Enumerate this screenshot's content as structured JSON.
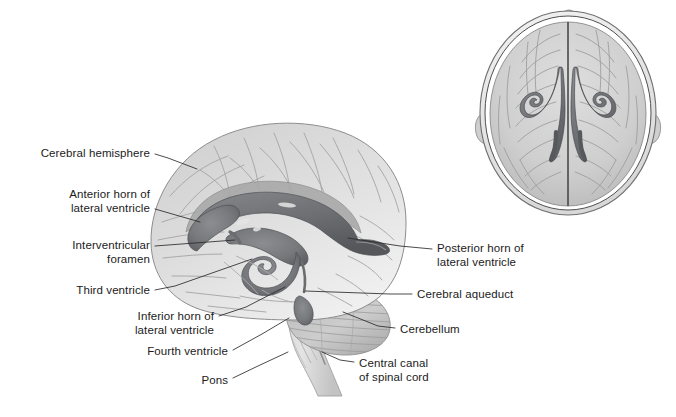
{
  "figure": {
    "background_color": "#ffffff",
    "label_color": "#1b1b1b",
    "leader_line_color": "#2a2a2a",
    "ventricle_color": "#6f7175",
    "brain_tissue_color": "#c9c9c9"
  },
  "views": {
    "lateral": {
      "name": "Midsagittal / lateral view of brain with ventricular system"
    },
    "superior": {
      "name": "Superior (top-down) view of head with lateral ventricles"
    }
  },
  "labels": [
    {
      "id": "cerebral-hemisphere",
      "lines": [
        "Cerebral hemisphere"
      ],
      "align": "right",
      "text_x": 28,
      "text_y": 147,
      "text_w": 122,
      "leader": [
        [
          155,
          154
        ],
        [
          168,
          158
        ],
        [
          197,
          169
        ]
      ]
    },
    {
      "id": "anterior-horn-of-lateral-ventricle",
      "lines": [
        "Anterior horn of",
        "lateral ventricle"
      ],
      "align": "right",
      "text_x": 26,
      "text_y": 188,
      "text_w": 124,
      "leader": [
        [
          155,
          209
        ],
        [
          200,
          222
        ]
      ]
    },
    {
      "id": "interventricular-foramen",
      "lines": [
        "Interventricular",
        "foramen"
      ],
      "align": "right",
      "text_x": 26,
      "text_y": 239,
      "text_w": 124,
      "leader": [
        [
          155,
          246
        ],
        [
          235,
          240
        ]
      ]
    },
    {
      "id": "third-ventricle",
      "lines": [
        "Third ventricle"
      ],
      "align": "right",
      "text_x": 52,
      "text_y": 284,
      "text_w": 98,
      "leader": [
        [
          155,
          290
        ],
        [
          175,
          286
        ],
        [
          252,
          259
        ]
      ]
    },
    {
      "id": "inferior-horn-of-lateral-ventricle",
      "lines": [
        "Inferior horn of",
        "lateral ventricle"
      ],
      "align": "right",
      "text_x": 100,
      "text_y": 310,
      "text_w": 114,
      "leader": [
        [
          219,
          316
        ],
        [
          246,
          307
        ],
        [
          285,
          287
        ]
      ]
    },
    {
      "id": "fourth-ventricle",
      "lines": [
        "Fourth ventricle"
      ],
      "align": "right",
      "text_x": 122,
      "text_y": 345,
      "text_w": 106,
      "leader": [
        [
          233,
          350
        ],
        [
          262,
          334
        ],
        [
          289,
          318
        ]
      ]
    },
    {
      "id": "pons",
      "lines": [
        "Pons"
      ],
      "align": "right",
      "text_x": 182,
      "text_y": 374,
      "text_w": 46,
      "leader": [
        [
          233,
          378
        ],
        [
          258,
          366
        ],
        [
          288,
          352
        ]
      ]
    },
    {
      "id": "posterior-horn-of-lateral-ventricle",
      "lines": [
        "Posterior horn of",
        "lateral ventricle"
      ],
      "align": "left",
      "text_x": 437,
      "text_y": 242,
      "text_w": 124,
      "leader": [
        [
          432,
          249
        ],
        [
          400,
          246
        ],
        [
          348,
          238
        ]
      ]
    },
    {
      "id": "cerebral-aqueduct",
      "lines": [
        "Cerebral aqueduct"
      ],
      "align": "left",
      "text_x": 417,
      "text_y": 288,
      "text_w": 122,
      "leader": [
        [
          412,
          294
        ],
        [
          390,
          294
        ],
        [
          305,
          291
        ]
      ]
    },
    {
      "id": "cerebellum",
      "lines": [
        "Cerebellum"
      ],
      "align": "left",
      "text_x": 400,
      "text_y": 323,
      "text_w": 80,
      "leader": [
        [
          395,
          328
        ],
        [
          378,
          326
        ],
        [
          343,
          312
        ]
      ]
    },
    {
      "id": "central-canal-of-spinal-cord",
      "lines": [
        "Central canal",
        "of spinal cord"
      ],
      "align": "left",
      "text_x": 359,
      "text_y": 357,
      "text_w": 100,
      "leader": [
        [
          354,
          362
        ],
        [
          340,
          360
        ],
        [
          322,
          352
        ]
      ]
    }
  ]
}
